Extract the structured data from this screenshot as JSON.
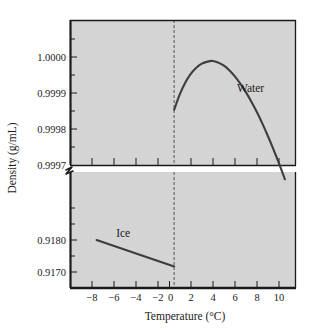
{
  "chart_data": {
    "type": "line",
    "title": "",
    "xlabel": "Temperature (°C)",
    "ylabel": "Density (g/mL)",
    "grid": false,
    "legend_position": "inline-annotation",
    "broken_axis": true,
    "axis_break_symbol": "zigzag",
    "xlim": [
      -9.4,
      11.0
    ],
    "xticks": [
      -9,
      -8,
      -7,
      -6,
      -5,
      -4,
      -3,
      -2,
      -1,
      0,
      1,
      2,
      3,
      4,
      5,
      6,
      7,
      8,
      9,
      10,
      11
    ],
    "xtick_labels": [
      {
        "value": -8,
        "label": "−8"
      },
      {
        "value": -6,
        "label": "−6"
      },
      {
        "value": -4,
        "label": "−4"
      },
      {
        "value": -2,
        "label": "−2"
      },
      {
        "value": 0,
        "label": "0"
      },
      {
        "value": 2,
        "label": "2"
      },
      {
        "value": 4,
        "label": "4"
      },
      {
        "value": 6,
        "label": "6"
      },
      {
        "value": 8,
        "label": "8"
      },
      {
        "value": 10,
        "label": "10"
      }
    ],
    "panels": [
      {
        "name": "upper-panel-water",
        "ylim": [
          0.9997,
          1.000125
        ],
        "ytick_labels": [
          {
            "value": 1.0,
            "label": "1.0000"
          },
          {
            "value": 0.9999,
            "label": "0.9999"
          },
          {
            "value": 0.9998,
            "label": "0.9998"
          },
          {
            "value": 0.9997,
            "label": "0.9997"
          }
        ],
        "yticks_minor": [
          1.00005,
          0.99995,
          0.99985,
          0.99975
        ]
      },
      {
        "name": "lower-panel-ice",
        "ylim": [
          0.91655,
          0.91925
        ],
        "ytick_labels": [
          {
            "value": 0.918,
            "label": "0.9180"
          },
          {
            "value": 0.917,
            "label": "0.9170"
          }
        ],
        "yticks_minor": [
          0.919,
          0.9185,
          0.9175
        ]
      }
    ],
    "series": [
      {
        "name": "Water",
        "label": "Water",
        "panel": "upper-panel-water",
        "x": [
          0.0,
          0.5,
          1.0,
          1.5,
          2.0,
          2.5,
          3.0,
          3.5,
          3.98,
          4.5,
          5.0,
          5.5,
          6.0,
          6.5,
          7.0,
          7.5,
          8.0,
          8.5,
          9.0,
          9.5,
          10.0
        ],
        "y": [
          0.999862,
          0.999906,
          0.999941,
          0.999967,
          0.999985,
          0.999997,
          1.000003,
          1.000005,
          1.0,
          0.999991,
          0.999977,
          0.999959,
          0.999937,
          0.999912,
          0.999884,
          0.999853,
          0.999819,
          0.999782,
          0.999743,
          0.999702,
          0.999658
        ]
      },
      {
        "name": "Ice",
        "label": "Ice",
        "panel": "lower-panel-ice",
        "x": [
          -7.0,
          0.0
        ],
        "y": [
          0.917665,
          0.91705
        ]
      }
    ],
    "annotations": [
      {
        "text": "Water",
        "x": 6.9,
        "y": 0.999925,
        "panel": "upper-panel-water"
      },
      {
        "text": "Ice",
        "x": -4.6,
        "y": 0.91783,
        "panel": "lower-panel-ice"
      }
    ],
    "zero_guide": {
      "x": 0,
      "style": "dashed",
      "spans_both_panels": true
    },
    "colors": {
      "background": "#ffffff",
      "plot_background": "#d4d4d4",
      "axis": "#1a1a1a",
      "curve": "#3d3d3d",
      "guide": "#555555",
      "text": "#1a1a1a"
    }
  },
  "axis_titles": {
    "x": "Temperature (°C)",
    "y": "Density (g/mL)"
  },
  "labels": {
    "water": "Water",
    "ice": "Ice"
  },
  "ytick_upper": {
    "t0": "1.0000",
    "t1": "0.9999",
    "t2": "0.9998",
    "t3": "0.9997"
  },
  "ytick_lower": {
    "t0": "0.9180",
    "t1": "0.9170"
  },
  "xtick": {
    "t0": "−8",
    "t1": "−6",
    "t2": "−4",
    "t3": "−2",
    "t4": "0",
    "t5": "2",
    "t6": "4",
    "t7": "6",
    "t8": "8",
    "t9": "10"
  }
}
